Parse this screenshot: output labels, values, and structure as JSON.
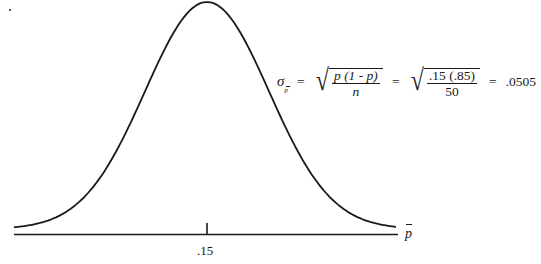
{
  "figure": {
    "type": "normal-distribution-diagram",
    "curve_color": "#1a1a1a",
    "axis": {
      "variable_label": "p",
      "variable_has_bar": true,
      "tick_label": ".15"
    },
    "formula": {
      "lhs_symbol": "σ",
      "lhs_subscript": "p",
      "equals": "=",
      "general_numerator": "p (1 - p)",
      "general_denominator": "n",
      "numeric_numerator": ".15 (.85)",
      "numeric_denominator": "50",
      "result": ".0505"
    }
  },
  "chart_data": {
    "type": "line",
    "title": "",
    "xlabel": "p̄",
    "ylabel": "",
    "mean": 0.15,
    "standard_error": 0.0505,
    "n": 50,
    "p": 0.15,
    "tick_labels": [
      ".15"
    ],
    "annotation": "σ_p̄ = √(p(1-p)/n) = √(.15(.85)/50) = .0505",
    "grid": false
  }
}
